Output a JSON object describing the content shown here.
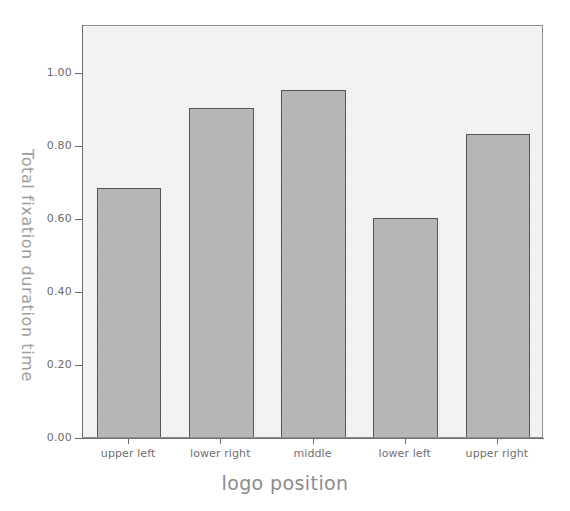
{
  "chart_data": {
    "type": "bar",
    "title": "",
    "subtitle": "",
    "xlabel": "logo position",
    "ylabel": "Total fixation duration time",
    "categories": [
      "upper left",
      "lower right",
      "middle",
      "lower left",
      "upper right"
    ],
    "values": [
      0.68,
      0.9,
      0.95,
      0.6,
      0.83
    ],
    "ylim": [
      0.0,
      1.13
    ],
    "yticks": [
      0.0,
      0.2,
      0.4,
      0.6,
      0.8,
      1.0
    ],
    "ytick_labels": [
      "0.00",
      "0.20",
      "0.40",
      "0.60",
      "0.80",
      "1.00"
    ],
    "grid": false,
    "legend": null,
    "legend_position": "none",
    "bar_fill_color": "#b6b6b6",
    "bar_edge_color": "#555555",
    "plot_background_color": "#f4f4f4",
    "axis_color": "#6d6d6d",
    "tick_label_color": "#6b6b6b",
    "axis_title_color": "#8b8b8b"
  },
  "axes": {
    "y_title": "Total fixation duration time",
    "x_title": "logo position"
  }
}
